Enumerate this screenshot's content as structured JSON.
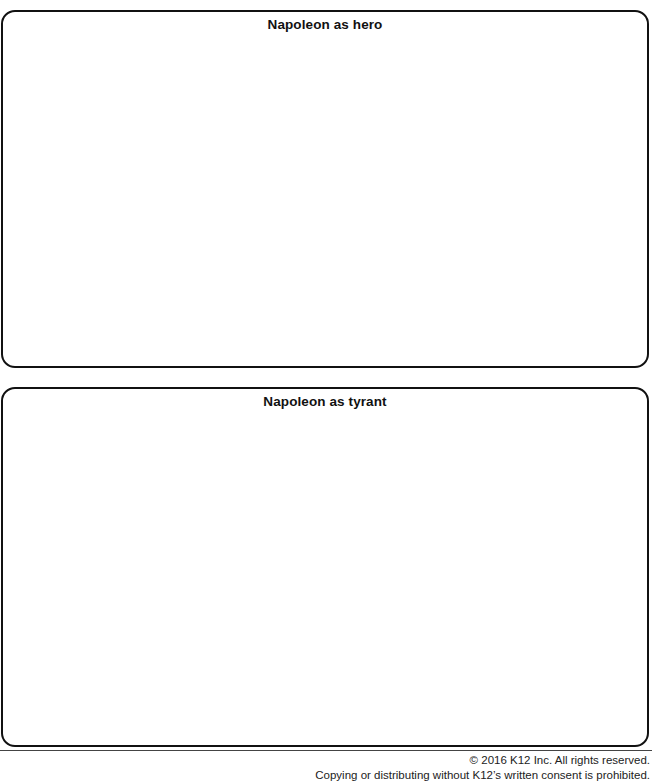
{
  "sections": [
    {
      "id": "hero",
      "title": "Napoleon as hero",
      "content": ""
    },
    {
      "id": "tyrant",
      "title": "Napoleon as tyrant",
      "content": ""
    }
  ],
  "footer": {
    "copyright": "© 2016 K12 Inc. All rights reserved.",
    "notice": "Copying or distributing without K12’s written consent is prohibited."
  },
  "colors": {
    "border": "#111111",
    "text": "#111111",
    "background": "#ffffff"
  }
}
